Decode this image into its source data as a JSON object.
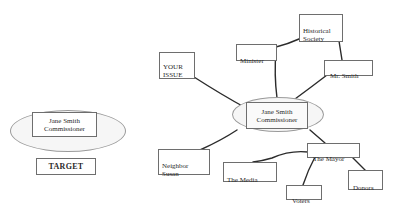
{
  "left_panel": {
    "target_person": {
      "line1": "Jane Smith",
      "line2": "Commissioner"
    },
    "target_label": "TARGET"
  },
  "network": {
    "center": {
      "line1": "Jane Smith",
      "line2": "Commissioner"
    },
    "nodes": {
      "your_issue": "YOUR\nISSUE",
      "minister": "Minister",
      "historical_society": "Historical\nSociety",
      "mr_smith": "Mr. Smith",
      "neighbor_susan": "Neighbor\nSusan",
      "the_media": "The Media",
      "the_mayor": "The Mayor",
      "voters": "Voters",
      "donors": "Donors"
    },
    "edges": [
      [
        "your_issue",
        "center"
      ],
      [
        "minister",
        "center"
      ],
      [
        "minister",
        "historical_society"
      ],
      [
        "historical_society",
        "mr_smith"
      ],
      [
        "mr_smith",
        "center"
      ],
      [
        "neighbor_susan",
        "center"
      ],
      [
        "center",
        "the_mayor"
      ],
      [
        "the_mayor",
        "the_media"
      ],
      [
        "the_mayor",
        "voters"
      ],
      [
        "the_mayor",
        "donors"
      ]
    ]
  },
  "colors": {
    "line": "#2b2b2b",
    "box_border": "#6e6e6e",
    "ellipse_fill": "#f6f6f6"
  }
}
